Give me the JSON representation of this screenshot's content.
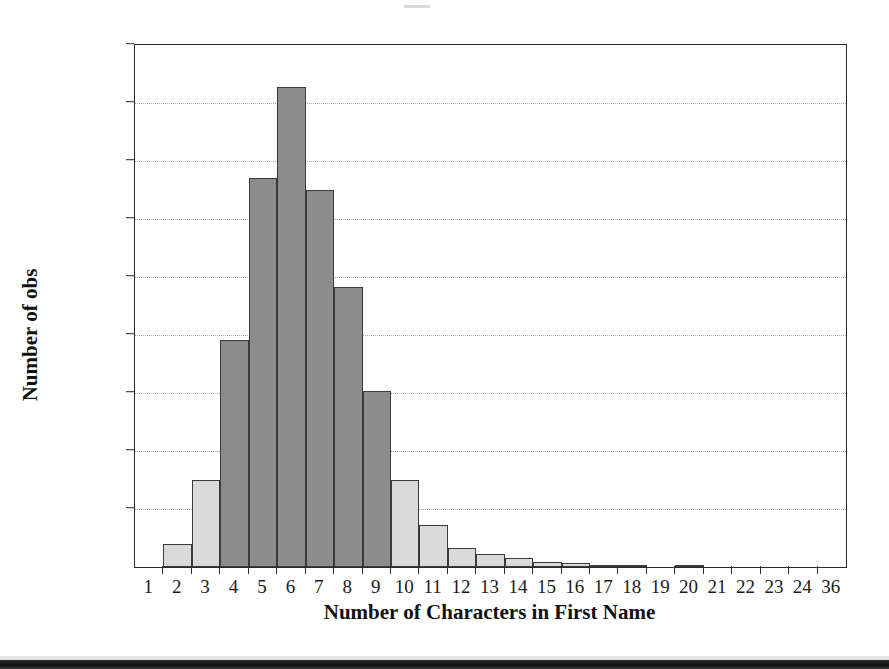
{
  "chart_data": {
    "type": "bar",
    "title": "",
    "subtitle": "",
    "xlabel": "Number of Characters in First Name",
    "ylabel": "Number of obs",
    "categories": [
      "1",
      "2",
      "3",
      "4",
      "5",
      "6",
      "7",
      "8",
      "9",
      "10",
      "11",
      "12",
      "13",
      "14",
      "15",
      "16",
      "17",
      "18",
      "19",
      "20",
      "21",
      "22",
      "23",
      "24",
      "36"
    ],
    "values": [
      0,
      400,
      1500,
      3910,
      6700,
      8280,
      6500,
      4820,
      3030,
      1500,
      720,
      330,
      230,
      150,
      90,
      70,
      40,
      20,
      0,
      20,
      0,
      0,
      0,
      0,
      0
    ],
    "ylim": [
      0,
      9000
    ],
    "xlim": [
      0,
      25
    ],
    "ytick_labels": [
      "0",
      "1000",
      "2000",
      "3000",
      "4000",
      "5000",
      "6000",
      "7000",
      "8000",
      "9000"
    ],
    "ytick_values": [
      0,
      1000,
      2000,
      3000,
      4000,
      5000,
      6000,
      7000,
      8000,
      9000
    ],
    "grid": "horizontal-dotted",
    "legend": "none",
    "bar_colors": {
      "light": "#d9d9d9",
      "dark": "#8c8c8c",
      "edge": "#3a3a3a"
    },
    "dark_bins": [
      "4",
      "5",
      "6",
      "7",
      "8",
      "9"
    ],
    "axis_color": "#2a2a2a",
    "background": "#ffffff"
  }
}
